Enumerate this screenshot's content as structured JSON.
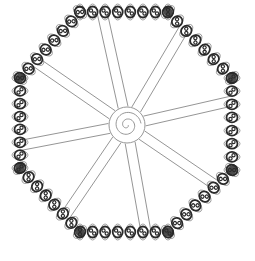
{
  "figure": {
    "title": "Wire-wrapped octagonal wheel",
    "colors": {
      "background": "#ffffff",
      "bead": "#2a2a2a",
      "loop": "#8a8a8a",
      "spoke": "#7a7a7a",
      "hub": "#8a8a8a"
    },
    "rim": {
      "shape": "octagon",
      "vertices": [
        [
          80,
          12
        ],
        [
          168,
          12
        ],
        [
          232,
          78
        ],
        [
          232,
          170
        ],
        [
          168,
          232
        ],
        [
          80,
          232
        ],
        [
          20,
          168
        ],
        [
          20,
          78
        ]
      ],
      "beads_per_side": 7
    },
    "hub": {
      "cx": 127,
      "cy": 125,
      "r": 18
    },
    "spokes": 8
  }
}
